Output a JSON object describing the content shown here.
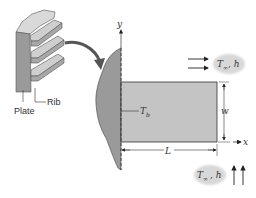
{
  "figure": {
    "inset_labels": {
      "plate": "Plate",
      "rib": "Rib"
    },
    "fin_labels": {
      "base_temperature": "T",
      "base_temperature_sub": "b",
      "length": "L",
      "width": "w",
      "x_axis": "x",
      "y_axis": "y"
    },
    "fluid_top": {
      "T": "T",
      "sub": "∞",
      "h": ", h"
    },
    "fluid_bottom": {
      "T": "T",
      "sub": "∞",
      "h": ", h"
    },
    "colors": {
      "fin_fill": "#c4c4c4",
      "wall_fill": "#9a9a9a",
      "line": "#222222",
      "cloud": "#d8d8d8"
    }
  }
}
